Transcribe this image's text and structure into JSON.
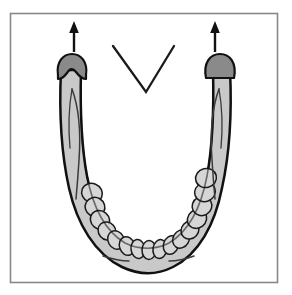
{
  "figure": {
    "title": "Mandible superior view with condylar movement arrows",
    "caption": "",
    "frame": {
      "x": 10,
      "y": 13,
      "width": 268,
      "height": 270,
      "stroke_color": "#888888",
      "fill_color": "#ffffff",
      "stroke_width": 1.5
    },
    "background_color": "#ffffff"
  },
  "colors": {
    "outline": "#111111",
    "bone_fill": "#c9c9c9",
    "condyle_fill": "#8a8a8a",
    "tooth_fill": "#d6d6d6",
    "tooth_outline": "#1a1a1a",
    "detail_line": "#333333",
    "arrow": "#111111",
    "chevron": "#1a1a1a",
    "frame_stroke": "#888888"
  },
  "elements": {
    "mandible_body": {
      "name": "mandible-body",
      "label": "Mandible (lower jaw) U-shaped body",
      "path": "M 62 68 C 60 110 62 150 70 186 C 78 222 95 252 122 266 C 138 274 156 274 172 266 C 198 252 214 222 221 186 C 229 150 231 110 229 68 L 212 68 C 213 108 212 142 206 174 C 200 206 188 230 168 242 C 155 249 140 249 126 242 C 106 230 93 206 87 174 C 81 142 79 108 80 68 Z",
      "fill": "#c9c9c9",
      "stroke": "#111111",
      "stroke_width": 2.4
    },
    "left_ramus": {
      "name": "left-ramus",
      "label": "Left ramus (ascending branch)",
      "path": "M 61 70 L 80 70 L 81 132 L 77 186 L 68 186 L 63 132 Z",
      "fill": "#c9c9c9",
      "stroke": "#111111"
    },
    "right_ramus": {
      "name": "right-ramus",
      "label": "Right ramus (ascending branch)",
      "path": "M 212 70 L 230 70 L 228 132 L 223 186 L 214 186 L 211 132 Z",
      "fill": "#c9c9c9",
      "stroke": "#111111"
    },
    "left_condyle": {
      "name": "left-condyle",
      "label": "Left condyle (notched, dark gray)",
      "cx": 71,
      "cy": 70,
      "rx": 14,
      "ry": 13,
      "fill": "#8a8a8a",
      "stroke": "#111111",
      "has_notch": true,
      "notch_label": "coronoid notch"
    },
    "right_condyle": {
      "name": "right-condyle",
      "label": "Right condyle (dome, dark gray)",
      "cx": 220,
      "cy": 70,
      "rx": 14,
      "ry": 13,
      "fill": "#8a8a8a",
      "stroke": "#111111",
      "has_notch": false
    },
    "left_arrow": {
      "name": "left-movement-arrow",
      "label": "Upward movement arrow over left condyle",
      "direction": "up",
      "x": 76,
      "y_tail": 57,
      "y_head": 24,
      "color": "#111111"
    },
    "right_arrow": {
      "name": "right-movement-arrow",
      "label": "Upward movement arrow over right condyle",
      "direction": "up",
      "x": 215,
      "y_tail": 57,
      "y_head": 24,
      "color": "#111111"
    },
    "chevron": {
      "name": "chevron-marker",
      "label": "V-shaped midline reference marker",
      "left_x": 113,
      "left_y": 46,
      "apex_x": 146,
      "apex_y": 92,
      "right_x": 174,
      "right_y": 46,
      "color": "#1a1a1a",
      "stroke_width": 2.2
    },
    "dental_arch": {
      "name": "dental-arch",
      "label": "Mandibular dental arch",
      "tooth_count": 16,
      "fill": "#d6d6d6",
      "stroke": "#1a1a1a"
    },
    "chin_detail_left": {
      "name": "chin-detail-line-left",
      "label": "Left chin contour accent line"
    },
    "chin_detail_right": {
      "name": "chin-detail-line-right",
      "label": "Right chin contour accent line"
    },
    "left_ramus_detail": {
      "name": "left-ramus-detail-line",
      "label": "Left ramus internal oblique line"
    },
    "right_ramus_detail": {
      "name": "right-ramus-detail-line",
      "label": "Right ramus internal oblique line"
    }
  },
  "teeth": [
    {
      "cx": 92,
      "cy": 193,
      "rx": 9.5,
      "ry": 10.5,
      "rot": -68
    },
    {
      "cx": 95,
      "cy": 207,
      "rx": 9.5,
      "ry": 10.0,
      "rot": -60
    },
    {
      "cx": 100,
      "cy": 220,
      "rx": 9.0,
      "ry": 10.0,
      "rot": -50
    },
    {
      "cx": 107,
      "cy": 231,
      "rx": 8.5,
      "ry": 9.5,
      "rot": -40
    },
    {
      "cx": 116,
      "cy": 240,
      "rx": 8.0,
      "ry": 9.5,
      "rot": -28
    },
    {
      "cx": 127,
      "cy": 246,
      "rx": 7.5,
      "ry": 9.5,
      "rot": -18
    },
    {
      "cx": 138,
      "cy": 249,
      "rx": 7.0,
      "ry": 9.5,
      "rot": -8
    },
    {
      "cx": 149,
      "cy": 250,
      "rx": 7.0,
      "ry": 9.5,
      "rot": 2
    },
    {
      "cx": 160,
      "cy": 249,
      "rx": 7.0,
      "ry": 9.5,
      "rot": 10
    },
    {
      "cx": 171,
      "cy": 245,
      "rx": 7.5,
      "ry": 9.5,
      "rot": 20
    },
    {
      "cx": 181,
      "cy": 239,
      "rx": 8.0,
      "ry": 9.5,
      "rot": 30
    },
    {
      "cx": 190,
      "cy": 230,
      "rx": 8.5,
      "ry": 9.5,
      "rot": 42
    },
    {
      "cx": 197,
      "cy": 219,
      "rx": 9.0,
      "ry": 10.0,
      "rot": 52
    },
    {
      "cx": 202,
      "cy": 206,
      "rx": 9.5,
      "ry": 10.0,
      "rot": 62
    },
    {
      "cx": 205,
      "cy": 192,
      "rx": 9.5,
      "ry": 10.5,
      "rot": 70
    },
    {
      "cx": 206,
      "cy": 178,
      "rx": 9.5,
      "ry": 10.5,
      "rot": 76
    }
  ]
}
